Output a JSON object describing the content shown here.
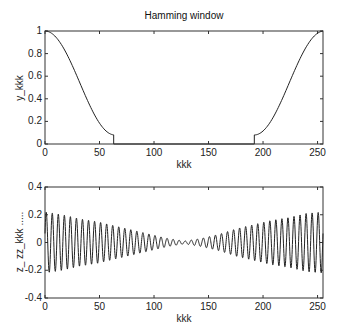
{
  "figure": {
    "width": 340,
    "height": 335,
    "background": "#ffffff",
    "line_color": "#222222"
  },
  "chart_data": [
    {
      "id": "top",
      "type": "line",
      "title": "Hamming window",
      "xlabel": "kkk",
      "ylabel": "y_kkk",
      "xlim": [
        0,
        255
      ],
      "ylim": [
        0,
        1
      ],
      "xticks": [
        0,
        50,
        100,
        150,
        200,
        250
      ],
      "yticks": [
        0,
        0.2,
        0.4,
        0.6,
        0.8,
        1
      ],
      "ytick_labels": [
        "0",
        "0.2",
        "0.4",
        "0.6",
        "0.8",
        "1"
      ],
      "grid": false,
      "legend": null,
      "description": "fftshifted half-Hamming window: falls from 1 at k=0 to ~0.08 at k~63, zero for 64..191, rises from ~0.08 at k~192 back to 1 at k=255",
      "series": [
        {
          "name": "y_kkk",
          "x": [
            0,
            8,
            16,
            24,
            32,
            40,
            48,
            56,
            63,
            64,
            191,
            192,
            199,
            207,
            215,
            223,
            231,
            239,
            247,
            255
          ],
          "y": [
            1.0,
            0.986,
            0.943,
            0.875,
            0.785,
            0.68,
            0.565,
            0.45,
            0.34,
            0.0,
            0.0,
            0.08,
            0.16,
            0.27,
            0.4,
            0.54,
            0.68,
            0.82,
            0.94,
            1.0
          ]
        }
      ],
      "plot_box": {
        "left": 45,
        "top": 31,
        "right": 323,
        "bottom": 144
      }
    },
    {
      "id": "bottom",
      "type": "line",
      "title": "",
      "xlabel": "kkk",
      "ylabel": "z_ zz_kkk .....",
      "xlim": [
        0,
        255
      ],
      "ylim": [
        -0.4,
        0.4
      ],
      "xticks": [
        0,
        50,
        100,
        150,
        200,
        250
      ],
      "yticks": [
        -0.4,
        -0.2,
        0,
        0.2,
        0.4
      ],
      "ytick_labels": [
        "-0.4",
        "-0.2",
        "0",
        "0.2",
        "0.4"
      ],
      "grid": false,
      "legend": null,
      "description": "Oscillating signal (~45 cycles) with amplitude ~0.2 at both ends, decaying to ~0.01 near k=128 (envelope follows the Hamming-type window shape)",
      "series": [
        {
          "name": "zz_kkk",
          "cycles": 46,
          "envelope_x": [
            0,
            16,
            32,
            48,
            64,
            80,
            96,
            112,
            128,
            144,
            160,
            176,
            192,
            208,
            224,
            240,
            255
          ],
          "envelope_y": [
            0.22,
            0.2,
            0.17,
            0.15,
            0.12,
            0.09,
            0.06,
            0.03,
            0.01,
            0.03,
            0.06,
            0.1,
            0.13,
            0.16,
            0.18,
            0.21,
            0.22
          ]
        }
      ],
      "plot_box": {
        "left": 45,
        "top": 187,
        "right": 323,
        "bottom": 298
      }
    }
  ]
}
